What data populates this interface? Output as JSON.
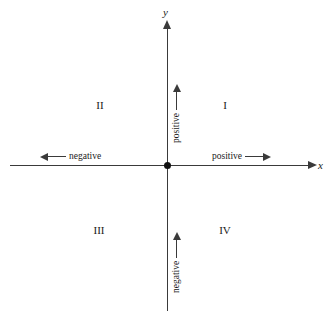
{
  "diagram": {
    "axes": {
      "x_label": "x",
      "y_label": "y"
    },
    "origin": {
      "marker": "filled-dot"
    },
    "quadrants": [
      {
        "id": "I",
        "label": "I",
        "position": "upper-right"
      },
      {
        "id": "II",
        "label": "II",
        "position": "upper-left"
      },
      {
        "id": "III",
        "label": "III",
        "position": "lower-left"
      },
      {
        "id": "IV",
        "label": "IV",
        "position": "lower-right"
      }
    ],
    "directions": {
      "x_negative": "negative",
      "x_positive": "positive",
      "y_positive": "positive",
      "y_negative": "negative"
    },
    "colors": {
      "background": "#ffffff",
      "axis": "#3a3a3a",
      "text": "#1a1a1a",
      "origin": "#111111"
    }
  }
}
